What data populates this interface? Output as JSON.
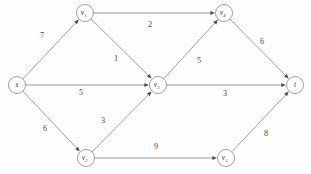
{
  "figure": {
    "name": "weighted-directed-graph",
    "background_color": "#fdfdfd",
    "line_color": "#8d8d8d",
    "arrow_color": "#4f4f4f",
    "label_color": "#4a4a4a",
    "node_fill": "#ffffff"
  },
  "graph": {
    "type": "directed-weighted-graph",
    "node_radius": 8.5,
    "nodes": [
      {
        "id": "s",
        "label": "s",
        "sub": "",
        "x": 17,
        "y": 85
      },
      {
        "id": "v1",
        "label": "v",
        "sub": "1",
        "x": 85,
        "y": 13
      },
      {
        "id": "v2",
        "label": "v",
        "sub": "2",
        "x": 86,
        "y": 158
      },
      {
        "id": "v3",
        "label": "v",
        "sub": "3",
        "x": 158,
        "y": 85
      },
      {
        "id": "v4",
        "label": "v",
        "sub": "4",
        "x": 224,
        "y": 13
      },
      {
        "id": "v5",
        "label": "v",
        "sub": "5",
        "x": 226,
        "y": 158
      },
      {
        "id": "t",
        "label": "t",
        "sub": "",
        "x": 295,
        "y": 85
      }
    ],
    "edges": [
      {
        "from": "s",
        "to": "v1",
        "weight": "7",
        "lx": 42,
        "ly": 35
      },
      {
        "from": "s",
        "to": "v3",
        "weight": "5",
        "lx": 81,
        "ly": 92
      },
      {
        "from": "s",
        "to": "v2",
        "weight": "6",
        "lx": 45,
        "ly": 128
      },
      {
        "from": "v1",
        "to": "v4",
        "weight": "2",
        "lx": 150,
        "ly": 24
      },
      {
        "from": "v1",
        "to": "v3",
        "weight": "1",
        "lx": 116,
        "ly": 58
      },
      {
        "from": "v2",
        "to": "v3",
        "weight": "3",
        "lx": 103,
        "ly": 120
      },
      {
        "from": "v2",
        "to": "v5",
        "weight": "9",
        "lx": 156,
        "ly": 146
      },
      {
        "from": "v3",
        "to": "v4",
        "weight": "5",
        "lx": 199,
        "ly": 60
      },
      {
        "from": "v3",
        "to": "t",
        "weight": "3",
        "lx": 225,
        "ly": 93
      },
      {
        "from": "v4",
        "to": "t",
        "weight": "6",
        "lx": 262,
        "ly": 41
      },
      {
        "from": "v5",
        "to": "t",
        "weight": "8",
        "lx": 266,
        "ly": 133
      }
    ]
  }
}
